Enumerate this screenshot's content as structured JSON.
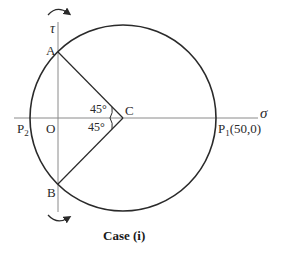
{
  "diagram": {
    "type": "mohr-circle",
    "caption": "Case (i)",
    "axes": {
      "horizontal_label": "σ",
      "vertical_label": "τ",
      "origin_label": "O"
    },
    "points": {
      "A": "A",
      "B": "B",
      "C": "C",
      "P1": "P",
      "P1_sub": "1",
      "P1_coords": "(50,0)",
      "P2": "P",
      "P2_sub": "2"
    },
    "angles": {
      "upper": "45°",
      "lower": "45°"
    },
    "colors": {
      "line": "#2a2a2a",
      "axis": "#888888"
    }
  }
}
